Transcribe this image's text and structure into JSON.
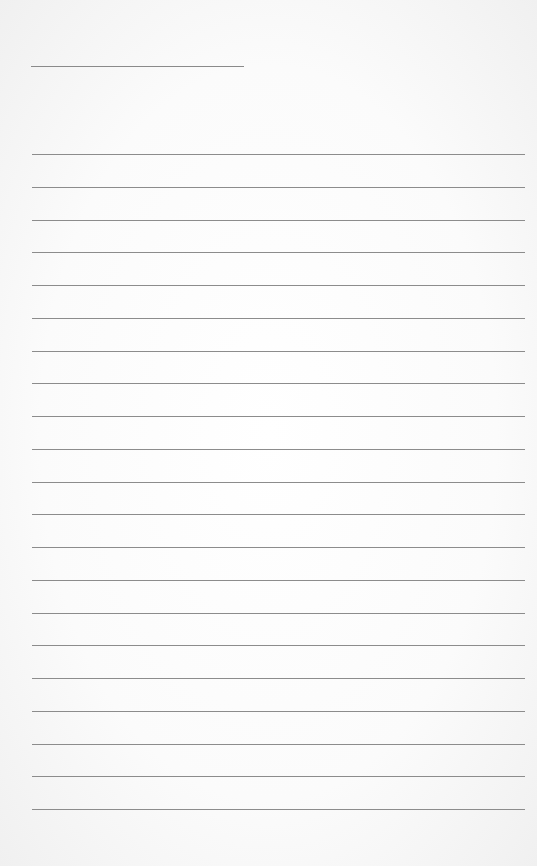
{
  "page": {
    "background": "#f6f6f6",
    "line_color": "#8c8c8c"
  },
  "title_line": {
    "x": 31,
    "y": 66,
    "width": 213
  },
  "ruled_lines": {
    "count": 21,
    "x": 32,
    "width": 493,
    "first_y": 154,
    "spacing": 32.75
  }
}
